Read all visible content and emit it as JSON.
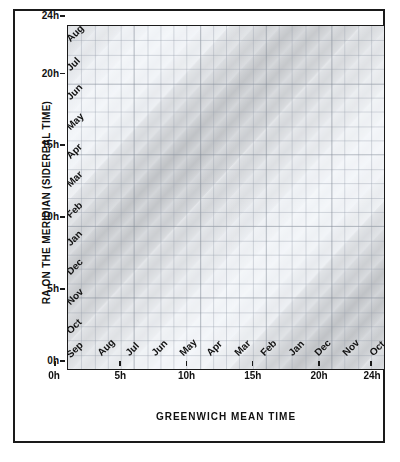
{
  "figure": {
    "title": "",
    "x_axis_title": "GREENWICH MEAN TIME",
    "y_axis_title": "RA ON THE MERIDIAN  (SIDEREAL TIME)"
  },
  "chart_data": {
    "type": "heatmap",
    "title": "",
    "subtitle": "",
    "xlabel": "GREENWICH MEAN TIME",
    "ylabel": "RA ON THE MERIDIAN  (SIDEREAL TIME)",
    "xlim": [
      0,
      24
    ],
    "ylim": [
      0,
      24
    ],
    "xtick_labels": [
      "0h",
      "5h",
      "10h",
      "15h",
      "20h",
      "24h"
    ],
    "xtick_values": [
      0,
      5,
      10,
      15,
      20,
      24
    ],
    "ytick_labels": [
      "0h",
      "5h",
      "10h",
      "15h",
      "20h",
      "24h"
    ],
    "ytick_values": [
      0,
      5,
      10,
      15,
      20,
      24
    ],
    "grid": true,
    "grid_spacing_hours": 1,
    "legend_position": "none",
    "annotations_note": "Diagonal month bands: RA = GMT + offset(month). Each diagonal labelled with a month name; band darkness encodes Milky Way / sky brightness density.",
    "month_diagonals": [
      {
        "month": "Jan",
        "ra_at_gmt0": 6.8,
        "shade": 0.62
      },
      {
        "month": "Feb",
        "ra_at_gmt0": 8.8,
        "shade": 0.5
      },
      {
        "month": "Mar",
        "ra_at_gmt0": 10.7,
        "shade": 0.38
      },
      {
        "month": "Apr",
        "ra_at_gmt0": 12.7,
        "shade": 0.22
      },
      {
        "month": "May",
        "ra_at_gmt0": 14.7,
        "shade": 0.16
      },
      {
        "month": "Jun",
        "ra_at_gmt0": 16.7,
        "shade": 0.14
      },
      {
        "month": "Jul",
        "ra_at_gmt0": 18.7,
        "shade": 0.18
      },
      {
        "month": "Aug",
        "ra_at_gmt0": 20.7,
        "shade": 0.26
      },
      {
        "month": "Sep",
        "ra_at_gmt0": 22.7,
        "shade": 0.34
      },
      {
        "month": "Oct",
        "ra_at_gmt0": 0.7,
        "shade": 0.42
      },
      {
        "month": "Nov",
        "ra_at_gmt0": 2.8,
        "shade": 0.52
      },
      {
        "month": "Dec",
        "ra_at_gmt0": 4.8,
        "shade": 0.6
      }
    ],
    "left_month_labels": [
      {
        "label": "Sep",
        "ra": 0.6
      },
      {
        "label": "Oct",
        "ra": 2.3
      },
      {
        "label": "Nov",
        "ra": 4.3
      },
      {
        "label": "Dec",
        "ra": 6.4
      },
      {
        "label": "Jan",
        "ra": 8.4
      },
      {
        "label": "Feb",
        "ra": 10.4
      },
      {
        "label": "Mar",
        "ra": 12.5
      },
      {
        "label": "Apr",
        "ra": 14.5
      },
      {
        "label": "May",
        "ra": 16.5
      },
      {
        "label": "Jun",
        "ra": 18.6
      },
      {
        "label": "Jul",
        "ra": 20.6
      },
      {
        "label": "Aug",
        "ra": 22.6
      }
    ],
    "bottom_month_labels": [
      {
        "label": "Sep",
        "gmt": 0.5
      },
      {
        "label": "Aug",
        "gmt": 2.5
      },
      {
        "label": "Jul",
        "gmt": 4.6
      },
      {
        "label": "Jun",
        "gmt": 6.6
      },
      {
        "label": "May",
        "gmt": 8.7
      },
      {
        "label": "Apr",
        "gmt": 10.7
      },
      {
        "label": "Mar",
        "gmt": 12.8
      },
      {
        "label": "Feb",
        "gmt": 14.8
      },
      {
        "label": "Jan",
        "gmt": 16.9
      },
      {
        "label": "Dec",
        "gmt": 18.9
      },
      {
        "label": "Nov",
        "gmt": 21.0
      },
      {
        "label": "Oct",
        "gmt": 23.0
      }
    ]
  },
  "colors": {
    "frame": "#1a1a1a",
    "axis": "#1b1b1b",
    "grid": "#b9bfca",
    "text": "#111111",
    "band_dark": "#8d939c",
    "band_light": "#e7eaee",
    "background": "#ffffff"
  }
}
